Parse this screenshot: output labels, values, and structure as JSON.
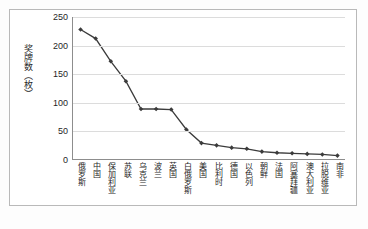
{
  "chart_data": {
    "type": "line",
    "title": "",
    "xlabel": "",
    "ylabel": "奖牌数（枚）",
    "ylim": [
      0,
      250
    ],
    "yticks": [
      0,
      50,
      100,
      150,
      200,
      250
    ],
    "grid": true,
    "legend": "none",
    "marker": "diamond",
    "line_color": "#3b3b3b",
    "marker_color": "#3b3b3b",
    "grid_color": "#dcdcdc",
    "axis_color": "#8d8d8d",
    "categories": [
      "俄罗斯",
      "中国",
      "保加利亚",
      "苏联",
      "乌克兰",
      "波兰",
      "英国",
      "白俄罗斯",
      "美国",
      "比利时",
      "德国",
      "以色列",
      "朝鲜",
      "法国",
      "阿塞拜疆",
      "澳大利亚",
      "拉脱维亚",
      "南非"
    ],
    "values": [
      228,
      212,
      172,
      137,
      88,
      88,
      87,
      52,
      28,
      24,
      20,
      18,
      13,
      11,
      10,
      9,
      8,
      6
    ]
  },
  "figure": {
    "caption": ""
  }
}
